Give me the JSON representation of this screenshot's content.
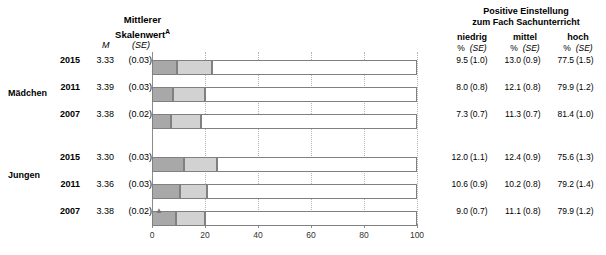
{
  "header": {
    "left_title_line1": "Mittlerer",
    "left_title_line2": "Skalenwert",
    "left_title_superscript": "A",
    "left_col_m": "M",
    "left_col_se": "(SE)",
    "right_title_line1": "Positive Einstellung",
    "right_title_line2": "zum Fach Sachunterricht",
    "right_categories": [
      {
        "label": "niedrig",
        "pct": "%",
        "se": "(SE)"
      },
      {
        "label": "mittel",
        "pct": "%",
        "se": "(SE)"
      },
      {
        "label": "hoch",
        "pct": "%",
        "se": "(SE)"
      }
    ]
  },
  "groups": [
    {
      "label": "Mädchen"
    },
    {
      "label": "Jungen"
    }
  ],
  "axis": {
    "ticks": [
      "0",
      "20",
      "40",
      "60",
      "80",
      "100"
    ],
    "min": 0,
    "max": 100
  },
  "colors": {
    "low": "#a8a8a8",
    "mid": "#d2d2d2",
    "high": "#ffffff",
    "border": "#808080",
    "grid": "#b4b4b4",
    "axis": "#8c8c8c"
  },
  "marker": {
    "triangle": "▲"
  },
  "chart_data": {
    "type": "bar",
    "title": "Positive Einstellung zum Fach Sachunterricht",
    "xlabel": "",
    "ylabel": "",
    "xlim": [
      0,
      100
    ],
    "grid": true,
    "legend_position": "none",
    "stacked": true,
    "categories": [
      "niedrig",
      "mittel",
      "hoch"
    ],
    "rows": [
      {
        "group": "Mädchen",
        "year": "2015",
        "mean": "3.33",
        "mean_se": "(0.03)",
        "marker": "",
        "values": [
          9.5,
          13.0,
          77.5
        ],
        "display": [
          {
            "pct": "9.5",
            "se": "(1.0)"
          },
          {
            "pct": "13.0",
            "se": "(0.9)"
          },
          {
            "pct": "77.5",
            "se": "(1.5)"
          }
        ]
      },
      {
        "group": "Mädchen",
        "year": "2011",
        "mean": "3.39",
        "mean_se": "(0.03)",
        "marker": "",
        "values": [
          8.0,
          12.1,
          79.9
        ],
        "display": [
          {
            "pct": "8.0",
            "se": "(0.8)"
          },
          {
            "pct": "12.1",
            "se": "(0.8)"
          },
          {
            "pct": "79.9",
            "se": "(1.2)"
          }
        ]
      },
      {
        "group": "Mädchen",
        "year": "2007",
        "mean": "3.38",
        "mean_se": "(0.02)",
        "marker": "",
        "values": [
          7.3,
          11.3,
          81.4
        ],
        "display": [
          {
            "pct": "7.3",
            "se": "(0.7)"
          },
          {
            "pct": "11.3",
            "se": "(0.7)"
          },
          {
            "pct": "81.4",
            "se": "(1.0)"
          }
        ]
      },
      {
        "group": "Jungen",
        "year": "2015",
        "mean": "3.30",
        "mean_se": "(0.03)",
        "marker": "",
        "values": [
          12.0,
          12.4,
          75.6
        ],
        "display": [
          {
            "pct": "12.0",
            "se": "(1.1)"
          },
          {
            "pct": "12.4",
            "se": "(0.9)"
          },
          {
            "pct": "75.6",
            "se": "(1.3)"
          }
        ]
      },
      {
        "group": "Jungen",
        "year": "2011",
        "mean": "3.36",
        "mean_se": "(0.03)",
        "marker": "",
        "values": [
          10.6,
          10.2,
          79.2
        ],
        "display": [
          {
            "pct": "10.6",
            "se": "(0.9)"
          },
          {
            "pct": "10.2",
            "se": "(0.8)"
          },
          {
            "pct": "79.2",
            "se": "(1.4)"
          }
        ]
      },
      {
        "group": "Jungen",
        "year": "2007",
        "mean": "3.38",
        "mean_se": "(0.02)",
        "marker": "▲",
        "values": [
          9.0,
          11.1,
          79.9
        ],
        "display": [
          {
            "pct": "9.0",
            "se": "(0.7)"
          },
          {
            "pct": "11.1",
            "se": "(0.8)"
          },
          {
            "pct": "79.9",
            "se": "(1.2)"
          }
        ]
      }
    ]
  }
}
